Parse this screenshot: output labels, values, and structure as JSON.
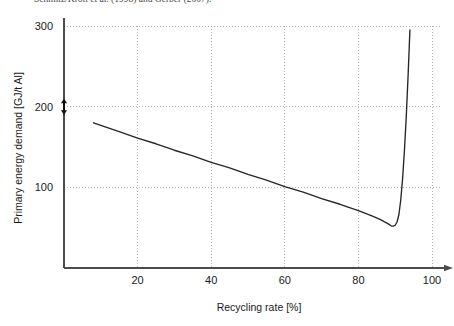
{
  "caption_fragment": "Schmitz/Kroll et al. (1998) and Gerber (2007).",
  "chart_data": {
    "type": "line",
    "title": "",
    "xlabel": "Recycling rate [%]",
    "ylabel": "Primary energy demand [GJ/t Al]",
    "xlim": [
      0,
      100
    ],
    "ylim": [
      0,
      300
    ],
    "xticks": [
      20,
      40,
      60,
      80,
      100
    ],
    "xtick_labels": [
      "20",
      "40",
      "60",
      "80",
      "100"
    ],
    "yticks": [
      100,
      200,
      300
    ],
    "ytick_labels": [
      "100",
      "200",
      "300"
    ],
    "grid": "dotted",
    "legend": "none",
    "series": [
      {
        "name": "Primary energy demand",
        "x": [
          8,
          15,
          20,
          25,
          30,
          35,
          40,
          45,
          50,
          55,
          60,
          65,
          70,
          75,
          80,
          84,
          86,
          88,
          89,
          89.5,
          90,
          90.5,
          91,
          91.5,
          92,
          92.5,
          93,
          93.5,
          94
        ],
        "y": [
          180,
          169,
          161,
          154,
          146,
          139,
          131,
          124,
          116,
          109,
          101,
          94,
          86,
          79,
          71,
          64,
          60,
          55,
          52,
          52,
          53,
          57,
          66,
          84,
          110,
          145,
          187,
          238,
          295
        ]
      }
    ],
    "annotations": [
      {
        "name": "y-axis-double-arrow-marker",
        "type": "double-headed-arrow",
        "axis": "y",
        "value": 200
      }
    ]
  },
  "axis": {
    "x_arrow": true,
    "y_arrow": true
  },
  "colors": {
    "curve": "#262626",
    "axis": "#4d4d4d",
    "grid": "#b3b3b3",
    "text": "#1a1a1a",
    "background": "#ffffff"
  }
}
